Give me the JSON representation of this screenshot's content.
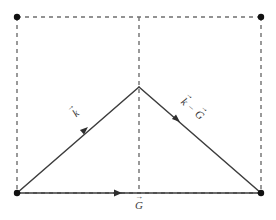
{
  "figure": {
    "background_color": "#ffffff",
    "solid_stroke_color": "#3d3d3d",
    "dashed_stroke_color": "#6f6f6f",
    "vertex_dot_color": "#111111",
    "label_color": "#3a3a3a"
  },
  "labels": {
    "k_vector": "k",
    "k_minus_G_vector_left": "k",
    "k_minus_G_minus_sign": "−",
    "k_minus_G_vector_right": "G",
    "G_vector": "G",
    "vector_accent": "→"
  },
  "geometry": {
    "rect": {
      "left": 17,
      "top": 17,
      "right": 261,
      "bottom": 193
    },
    "apex": {
      "x": 139,
      "y": 87
    },
    "midline_x": 139,
    "dash_pattern": "4 4",
    "dot_radius": 3.2
  },
  "vertices": [
    {
      "name": "top-left",
      "x": 17,
      "y": 17
    },
    {
      "name": "top-right",
      "x": 261,
      "y": 17
    },
    {
      "name": "bottom-left",
      "x": 17,
      "y": 193
    },
    {
      "name": "bottom-right",
      "x": 261,
      "y": 193
    }
  ],
  "vectors": [
    {
      "name": "k",
      "from": "bottom-left",
      "to": "apex",
      "arrow_at": {
        "x": 88,
        "y": 127
      },
      "direction": "up-right"
    },
    {
      "name": "k-minus-G",
      "from": "apex",
      "to": "bottom-right",
      "arrow_at": {
        "x": 180,
        "y": 122
      },
      "direction": "down-right"
    },
    {
      "name": "G",
      "from": "bottom-left",
      "to": "bottom-right",
      "arrow_at": {
        "x": 122,
        "y": 193
      },
      "direction": "right"
    }
  ]
}
